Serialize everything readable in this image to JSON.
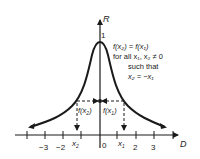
{
  "diagram": {
    "axes": {
      "vertical_label": "R",
      "horizontal_label": "D",
      "peak_value_label": "1"
    },
    "x_ticks": [
      {
        "label": "−3",
        "x": 45
      },
      {
        "label": "−2",
        "x": 62
      },
      {
        "label": "0",
        "x": 104
      },
      {
        "label": "2",
        "x": 136
      },
      {
        "label": "3",
        "x": 154
      }
    ],
    "points": {
      "x2_label": "x",
      "x2_sub": "2",
      "x1_label": "x",
      "x1_sub": "1",
      "f_x2_label": "f(x",
      "f_x2_sub": "2",
      "f_x1_label": "f(x",
      "f_x1_sub": "1"
    },
    "annotation": {
      "line1": "f(x₂) = f(x₁)",
      "line2": "for all x₁, x₂ ≠ 0",
      "line3": "such that",
      "line4": "x₂ = −x₁"
    },
    "colors": {
      "ink": "#1a1a1a",
      "background": "#ffffff"
    }
  }
}
